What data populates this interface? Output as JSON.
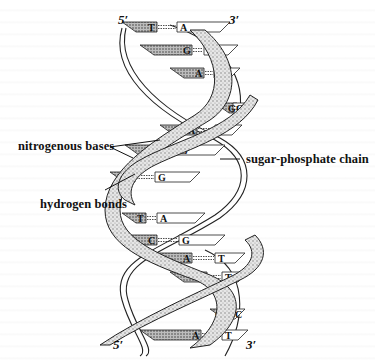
{
  "diagram": {
    "ends": {
      "top_left": "5′",
      "top_right": "3′",
      "bottom_left": "5′",
      "bottom_right": "3′"
    },
    "labels": {
      "nitrogenous_bases": "nitrogenous bases",
      "hydrogen_bonds": "hydrogen bonds",
      "sugar_phosphate_chain": "sugar-phosphate chain"
    },
    "base_pairs": [
      {
        "left": "T",
        "right": "A"
      },
      {
        "left": "G",
        "right": "C"
      },
      {
        "left": "A",
        "right": "T"
      },
      {
        "left": "G",
        "right": "C"
      },
      {
        "left": "A",
        "right": "T"
      },
      {
        "left": "C",
        "right": "G"
      },
      {
        "left": "C",
        "right": "G"
      },
      {
        "left": "T",
        "right": "A"
      },
      {
        "left": "C",
        "right": "G"
      },
      {
        "left": "A",
        "right": "T"
      },
      {
        "left": "A",
        "right": "T"
      },
      {
        "left": "G",
        "right": "C"
      },
      {
        "left": "A",
        "right": "T"
      }
    ]
  }
}
